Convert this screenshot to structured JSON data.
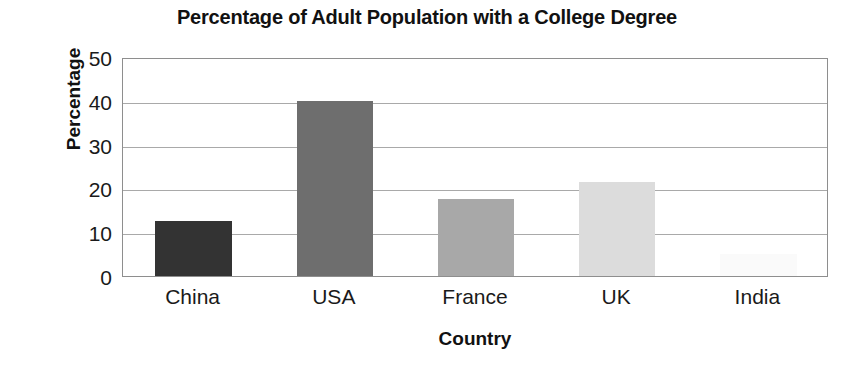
{
  "chart_data": {
    "type": "bar",
    "title": "Percentage of Adult Population with a College Degree",
    "xlabel": "Country",
    "ylabel": "Percentage",
    "categories": [
      "China",
      "USA",
      "France",
      "UK",
      "India"
    ],
    "values": [
      12.5,
      40,
      17.5,
      21.5,
      5
    ],
    "bar_colors": [
      "#333333",
      "#6e6e6e",
      "#a8a8a8",
      "#dcdcdc",
      "#fafafa"
    ],
    "ylim": [
      0,
      50
    ],
    "yticks": [
      0,
      10,
      20,
      30,
      40,
      50
    ],
    "ytick_labels": [
      "0",
      "10",
      "20",
      "30",
      "40",
      "50"
    ],
    "grid": true,
    "grid_axis": "y",
    "legend": false,
    "legend_position": "none",
    "axis_line_color": "#8e8e8e",
    "gridline_color": "#a9a9a9",
    "background_color": "#ffffff",
    "text_color": "#1a1a1a"
  }
}
